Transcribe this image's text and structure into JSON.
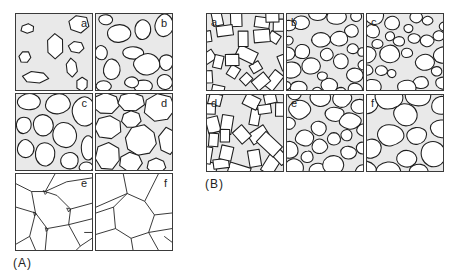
{
  "figure": {
    "groups": [
      {
        "id": "A",
        "caption": "(A)",
        "panels": [
          {
            "label": "a",
            "stage": "isolated-grains"
          },
          {
            "label": "b",
            "stage": "growing-grains"
          },
          {
            "label": "c",
            "stage": "contacting-grains"
          },
          {
            "label": "d",
            "stage": "shrinking-pores"
          },
          {
            "label": "e",
            "stage": "triple-junction-pores"
          },
          {
            "label": "f",
            "stage": "fully-dense-polygonal"
          }
        ]
      },
      {
        "id": "B",
        "caption": "(B)",
        "panels": [
          {
            "label": "a",
            "stage": "angular-fragments"
          },
          {
            "label": "b",
            "stage": "rounded-grains"
          },
          {
            "label": "c",
            "stage": "rounded-grains-necking"
          },
          {
            "label": "d",
            "stage": "angular-fragments"
          },
          {
            "label": "e",
            "stage": "partially-sintered"
          },
          {
            "label": "f",
            "stage": "polygonal-with-pores"
          }
        ]
      }
    ],
    "colors": {
      "pore_fill": "#e9e9e9",
      "grain_fill": "#ffffff",
      "outline": "#1e1e1e"
    }
  }
}
